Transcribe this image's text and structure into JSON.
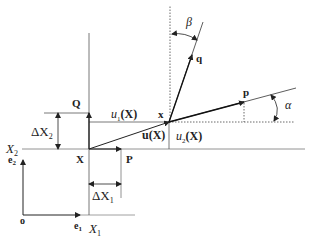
{
  "diagram": {
    "type": "continuum-mechanics-deformation",
    "labels": {
      "origin": "o",
      "e1": "e",
      "e1_sub": "1",
      "e2": "e",
      "e2_sub": "2",
      "X1_axis": "X",
      "X1_sub": "1",
      "X2_axis": "X",
      "X2_sub": "2",
      "point_X": "X",
      "point_P": "P",
      "point_Q": "Q",
      "point_x": "x",
      "vec_p": "p",
      "vec_q": "q",
      "dX1": "ΔX",
      "dX1_sub": "1",
      "dX2": "ΔX",
      "dX2_sub": "2",
      "u1": "u",
      "u1_sub": "1",
      "u1_arg": "(X)",
      "u2": "u",
      "u2_sub": "2",
      "u2_arg": "(X)",
      "u_vec": "u(X)",
      "alpha": "α",
      "beta": "β"
    },
    "colors": {
      "line": "#333333",
      "grid": "#888888",
      "background": "#ffffff"
    }
  }
}
